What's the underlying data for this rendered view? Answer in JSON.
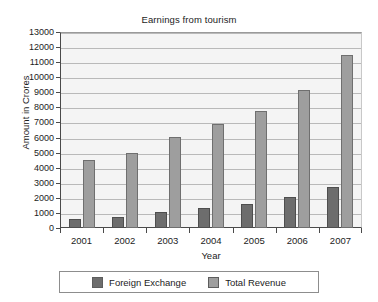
{
  "chart_data": {
    "type": "bar",
    "title": "Earnings from tourism",
    "xlabel": "Year",
    "ylabel": "Amount in Crores",
    "categories": [
      "2001",
      "2002",
      "2003",
      "2004",
      "2005",
      "2006",
      "2007"
    ],
    "series": [
      {
        "name": "Foreign Exchange",
        "color": "#6d6d6d",
        "values": [
          600,
          750,
          1080,
          1320,
          1600,
          2050,
          2700
        ]
      },
      {
        "name": "Total Revenue",
        "color": "#9e9e9e",
        "values": [
          4530,
          5000,
          6050,
          6900,
          7750,
          9150,
          11500
        ]
      }
    ],
    "ylim": [
      0,
      13000
    ],
    "ytick_step": 1000,
    "yticks": [
      0,
      1000,
      2000,
      3000,
      4000,
      5000,
      6000,
      7000,
      8000,
      9000,
      10000,
      11000,
      12000,
      13000
    ],
    "ytick_labels": [
      "0",
      "1000",
      "2000",
      "3000",
      "4000",
      "5000",
      "6000",
      "7000",
      "8000",
      "9000",
      "10000",
      "11000",
      "12000",
      "13000"
    ],
    "grid": true,
    "grid_axis": "y",
    "legend_position": "bottom",
    "plot_background": "#f4f4f4",
    "axis_color": "#4a4a4a",
    "grid_color": "#b9b9b9"
  }
}
